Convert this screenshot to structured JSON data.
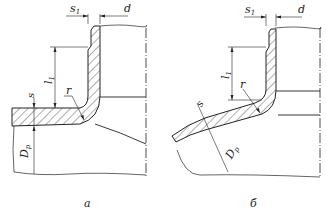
{
  "figure": {
    "panels": [
      {
        "id": "a",
        "caption": "а",
        "labels": {
          "s1": "s",
          "s1_sub": "1",
          "d": "d",
          "l1": "l",
          "l1_sub": "1",
          "r": "r",
          "s": "s",
          "Dp": "D",
          "Dp_sub": "p"
        }
      },
      {
        "id": "b",
        "caption": "б",
        "labels": {
          "s1": "s",
          "s1_sub": "1",
          "d": "d",
          "l1": "l",
          "l1_sub": "1",
          "r": "r",
          "s": "s",
          "Dp": "D",
          "Dp_sub": "p"
        }
      }
    ],
    "colors": {
      "line": "#222222",
      "hatch": "#333333",
      "background": "#ffffff"
    }
  }
}
